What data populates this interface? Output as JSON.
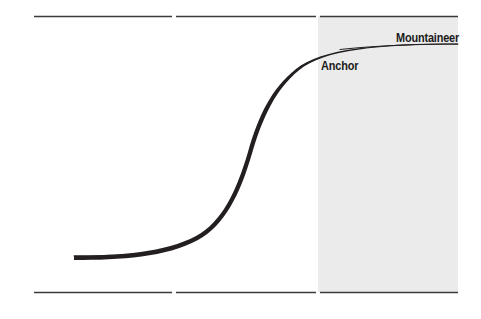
{
  "figure": {
    "background_color": "#ffffff",
    "width": 481,
    "height": 319
  },
  "labels": {
    "mountaineer": "Mountaineer",
    "anchor": "Anchor"
  },
  "colors": {
    "curve": "#231f20",
    "rule": "#3a3a3a",
    "shaded_region": "#ebebeb",
    "text": "#1a1a1a"
  },
  "chart_data": {
    "type": "line",
    "title": "",
    "subtitle": "",
    "xlabel": "",
    "ylabel": "",
    "grid": false,
    "legend_position": "inline-annotations",
    "axis_visible": false,
    "xlim": [
      0,
      481
    ],
    "ylim": [
      0,
      319
    ],
    "series": [
      {
        "name": "S-curve",
        "stroke": "#231f20",
        "stroke_weight_min": 0.9,
        "stroke_weight_max": 4.2,
        "points": [
          {
            "x": 74,
            "y": 256
          },
          {
            "x": 100,
            "y": 256
          },
          {
            "x": 130,
            "y": 255
          },
          {
            "x": 155,
            "y": 252
          },
          {
            "x": 175,
            "y": 247
          },
          {
            "x": 193,
            "y": 238
          },
          {
            "x": 208,
            "y": 226
          },
          {
            "x": 222,
            "y": 209
          },
          {
            "x": 234,
            "y": 190
          },
          {
            "x": 244,
            "y": 170
          },
          {
            "x": 252,
            "y": 150
          },
          {
            "x": 260,
            "y": 131
          },
          {
            "x": 268,
            "y": 113
          },
          {
            "x": 277,
            "y": 96
          },
          {
            "x": 288,
            "y": 81
          },
          {
            "x": 300,
            "y": 68
          },
          {
            "x": 314,
            "y": 58
          },
          {
            "x": 330,
            "y": 51
          },
          {
            "x": 350,
            "y": 47
          },
          {
            "x": 375,
            "y": 45
          },
          {
            "x": 410,
            "y": 44
          },
          {
            "x": 458,
            "y": 44
          }
        ]
      }
    ],
    "annotations": [
      {
        "text": "Mountaineer",
        "x": 458,
        "y": 38,
        "align": "right",
        "placement": "above-curve-right-plateau"
      },
      {
        "text": "Anchor",
        "x": 322,
        "y": 66,
        "align": "left",
        "placement": "below-curve-upper-knee"
      }
    ],
    "shaded_regions": [
      {
        "name": "mountaineer-band",
        "x_start": 318,
        "x_end": 458,
        "y_start": 16,
        "y_end": 292,
        "color": "#ebebeb"
      }
    ],
    "rules": [
      {
        "name": "top-rule",
        "y": 16,
        "segments": [
          [
            34,
            172
          ],
          [
            176,
            316
          ],
          [
            320,
            458
          ]
        ]
      },
      {
        "name": "bottom-rule",
        "y": 292,
        "segments": [
          [
            34,
            172
          ],
          [
            176,
            316
          ],
          [
            320,
            458
          ]
        ]
      }
    ]
  }
}
